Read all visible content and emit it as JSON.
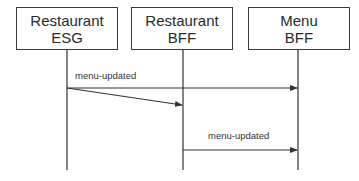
{
  "participants": [
    {
      "line1": "Restaurant",
      "line2": "ESG"
    },
    {
      "line1": "Restaurant",
      "line2": "BFF"
    },
    {
      "line1": "Menu",
      "line2": "BFF"
    }
  ],
  "messages": [
    {
      "label": "menu-updated",
      "from": "Restaurant ESG",
      "to": "Menu BFF"
    },
    {
      "label": "",
      "from": "Restaurant ESG",
      "to": "Restaurant BFF"
    },
    {
      "label": "menu-updated",
      "from": "Restaurant BFF",
      "to": "Menu BFF"
    }
  ],
  "colors": {
    "line": "#333333",
    "text": "#2a2a2a"
  }
}
